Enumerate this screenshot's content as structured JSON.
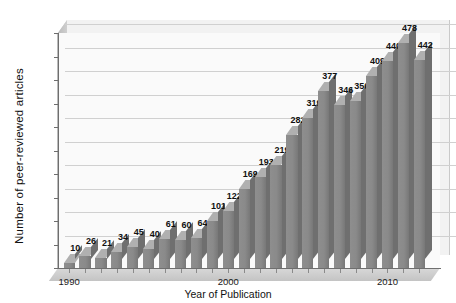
{
  "chart_data": {
    "type": "bar",
    "title": "",
    "subtitle": "",
    "xlabel": "Year of Publication",
    "ylabel": "Number  of peer-reviewed articles",
    "categories": [
      "1990",
      "1991",
      "1992",
      "1993",
      "1994",
      "1995",
      "1996",
      "1997",
      "1998",
      "1999",
      "2000",
      "2001",
      "2002",
      "2003",
      "2004",
      "2005",
      "2006",
      "2007",
      "2008",
      "2009",
      "2010",
      "2011",
      "2012"
    ],
    "values": [
      10,
      26,
      21,
      34,
      45,
      40,
      61,
      60,
      64,
      101,
      122,
      169,
      193,
      219,
      282,
      319,
      377,
      346,
      356,
      409,
      440,
      478,
      442
    ],
    "data_labels": [
      "10",
      "26",
      "21",
      "34",
      "45",
      "40",
      "61",
      "60",
      "64",
      "101",
      "122",
      "169",
      "193",
      "219",
      "282",
      "319",
      "377",
      "346",
      "356",
      "409",
      "440",
      "478",
      "442"
    ],
    "ylim": [
      0,
      500
    ],
    "ytick_values": [
      0,
      50,
      100,
      150,
      200,
      250,
      300,
      350,
      400,
      450,
      500
    ],
    "ytick_labels": [
      "0",
      "50",
      "100",
      "150",
      "200",
      "250",
      "300",
      "350",
      "400",
      "450",
      "500"
    ],
    "xtick_labels": [
      "1990",
      "2000",
      "2010"
    ],
    "xtick_categories": [
      "1990",
      "2000",
      "2010"
    ],
    "grid": true,
    "grid_axis": "y",
    "legend": false,
    "legend_position": "none",
    "bar_color": "#8a8a8a",
    "bar_top_color": "#b0b0b0",
    "bar_side_color": "#6f6f6f",
    "plot_background": "#fafafa",
    "wall_background": "#f2f2f2",
    "gridline_color": "#d0d0d0",
    "axis_color": "#6e6e6e",
    "label_color": "#111111",
    "style": "3d-column"
  }
}
